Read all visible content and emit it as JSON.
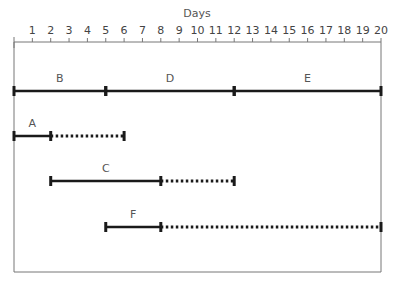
{
  "chart_data": {
    "type": "gantt",
    "title": "Days",
    "xlabel": "Days",
    "ylabel": "",
    "xlim": [
      0,
      20
    ],
    "x_ticks": [
      1,
      2,
      3,
      4,
      5,
      6,
      7,
      8,
      9,
      10,
      11,
      12,
      13,
      14,
      15,
      16,
      17,
      18,
      19,
      20
    ],
    "grid": false,
    "critical_path": [
      {
        "name": "B",
        "start": 0,
        "end": 5
      },
      {
        "name": "D",
        "start": 5,
        "end": 12
      },
      {
        "name": "E",
        "start": 12,
        "end": 20
      }
    ],
    "activities": [
      {
        "name": "A",
        "start": 0,
        "end": 2,
        "float_end": 6
      },
      {
        "name": "C",
        "start": 2,
        "end": 8,
        "float_end": 12
      },
      {
        "name": "F",
        "start": 5,
        "end": 8,
        "float_end": 20
      }
    ],
    "legend": {
      "solid": "activity duration",
      "dotted": "float"
    }
  },
  "colors": {
    "bar": "#1a1a1a",
    "frame": "#777777",
    "text": "#555555"
  }
}
